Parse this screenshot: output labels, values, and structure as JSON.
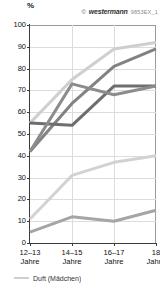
{
  "credit": {
    "mark": "©",
    "brand": "westermann",
    "code": "9853EX_1"
  },
  "chart_data": {
    "type": "line",
    "title": "",
    "xlabel": "",
    "ylabel": "%",
    "ylim": [
      0,
      100
    ],
    "ytick_step": 10,
    "grid": true,
    "legend_position": "bottom-left",
    "categories": [
      "12–13\nJahre",
      "14–15\nJahre",
      "16–17\nJahre",
      "18\nJahre"
    ],
    "category_lines": [
      {
        "l1": "12–13",
        "l2": "Jahre"
      },
      {
        "l1": "14–15",
        "l2": "Jahre"
      },
      {
        "l1": "16–17",
        "l2": "Jahre"
      },
      {
        "l1": "18",
        "l2": "Jahre"
      }
    ],
    "yticks": [
      0,
      10,
      20,
      30,
      40,
      50,
      60,
      70,
      80,
      90,
      100
    ],
    "series": [
      {
        "name": "series-1",
        "color": "#cfcfcf",
        "values": [
          55,
          75,
          89,
          92
        ]
      },
      {
        "name": "series-2",
        "color": "#828282",
        "values": [
          42,
          64,
          81,
          89
        ]
      },
      {
        "name": "series-3",
        "color": "#6e6e6e",
        "values": [
          55,
          54,
          72,
          72
        ]
      },
      {
        "name": "series-4",
        "color": "#8c8c8c",
        "values": [
          42,
          73,
          68,
          72
        ]
      },
      {
        "name": "series-5",
        "color": "#d2d2d2",
        "values": [
          11,
          31,
          37,
          40
        ]
      },
      {
        "name": "series-6",
        "color": "#a5a5a5",
        "values": [
          5,
          12,
          10,
          15
        ]
      }
    ],
    "legend": [
      {
        "label": "Duft (Mädchen)",
        "color": "#cfcfcf"
      }
    ]
  }
}
